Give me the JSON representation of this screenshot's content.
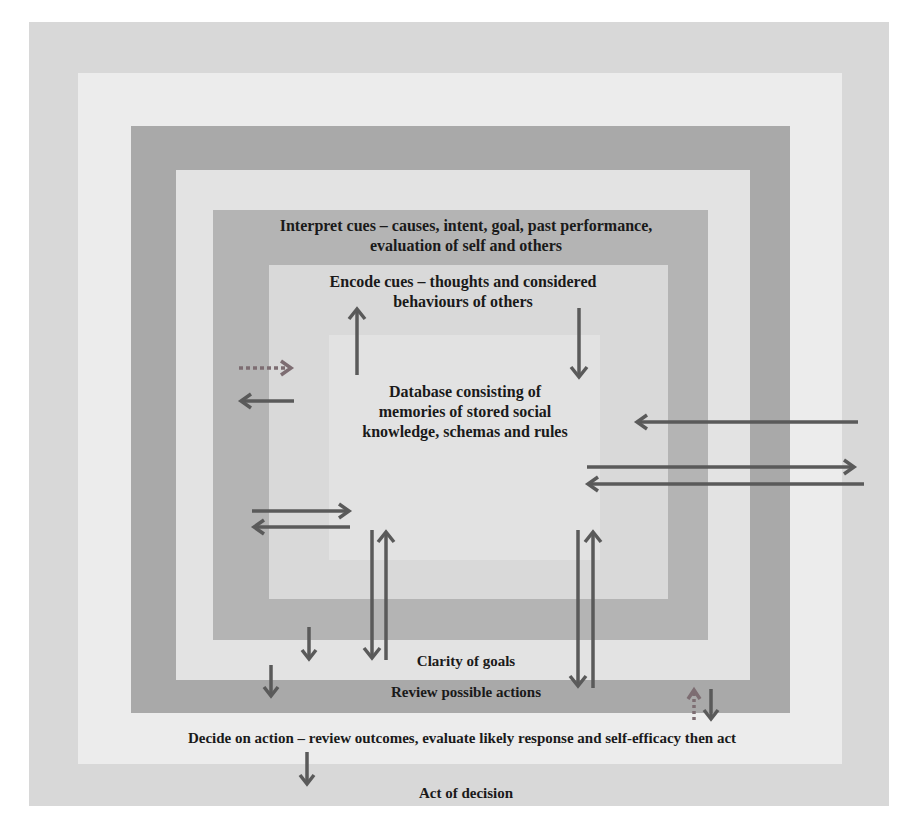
{
  "diagram": {
    "type": "nested-boxes-flow",
    "colors": {
      "background": "#ffffff",
      "band1": "#d8d8d8",
      "band2": "#ececec",
      "band3": "#a9a9a9",
      "band4": "#e3e3e3",
      "band5": "#b4b4b4",
      "band6": "#d9d9d9",
      "band7": "#e2e2e2",
      "arrow": "#5a5a5a",
      "dotted_arrow": "#7d6d72",
      "text": "#1a1a1a"
    },
    "labels": {
      "interpret_cues": {
        "line1": "Interpret cues – causes, intent, goal, past performance,",
        "line2": "evaluation of self and others"
      },
      "encode_cues": {
        "line1": "Encode cues – thoughts and considered",
        "line2": "behaviours of others"
      },
      "database": {
        "line1": "Database consisting of",
        "line2": "memories of stored social",
        "line3": "knowledge, schemas and rules"
      },
      "clarity_of_goals": "Clarity of goals",
      "review_possible_actions": "Review possible actions",
      "decide_on_action": "Decide on action – review outcomes, evaluate likely response and self-efficacy then act",
      "act_of_decision": "Act of decision"
    }
  }
}
